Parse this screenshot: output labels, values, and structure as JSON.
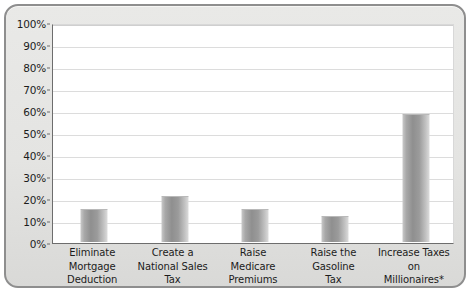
{
  "chart_data": {
    "type": "bar",
    "title": "",
    "subtitle": "",
    "xlabel": "",
    "ylabel": "",
    "ylim": [
      0,
      100
    ],
    "y_unit": "%",
    "grid": true,
    "legend": "none",
    "y_ticks": [
      "100%",
      "90%",
      "80%",
      "70%",
      "60%",
      "50%",
      "40%",
      "30%",
      "20%",
      "10%",
      "0%"
    ],
    "y_tick_values": [
      100,
      90,
      80,
      70,
      60,
      50,
      40,
      30,
      20,
      10,
      0
    ],
    "categories": [
      "Eliminate Mortgage Deduction",
      "Create a National Sales Tax",
      "Raise Medicare Premiums",
      "Raise the Gasoline Tax",
      "Increase Taxes on Millionaires*"
    ],
    "category_lines": [
      [
        "Eliminate",
        "Mortgage",
        "Deduction"
      ],
      [
        "Create a",
        "National Sales",
        "Tax"
      ],
      [
        "Raise",
        "Medicare",
        "Premiums"
      ],
      [
        "Raise the",
        "Gasoline",
        "Tax"
      ],
      [
        "Increase Taxes",
        "on",
        "Millionaires*"
      ]
    ],
    "values": [
      15,
      21,
      15,
      12,
      58
    ],
    "bar_color": "#9b9b9b",
    "grid_color": "#dcdcdc",
    "axis_color": "#6d6d6d",
    "plot_background": "#ffffff",
    "frame_background": "#e6e6e4"
  }
}
